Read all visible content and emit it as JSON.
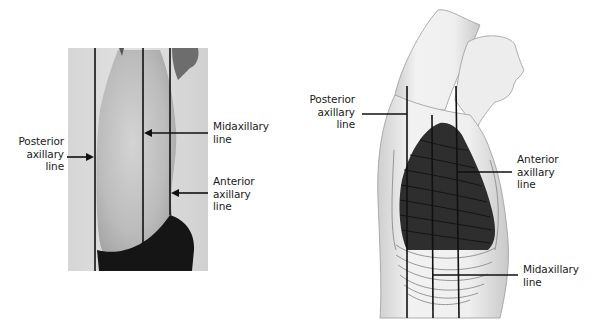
{
  "figure": {
    "left_panel": {
      "type": "photograph",
      "subject": "lateral view of torso with arm raised",
      "labels": {
        "posterior": {
          "line1": "Posterior",
          "line2": "axillary",
          "line3": "line"
        },
        "midaxillary": {
          "line1": "Midaxillary",
          "line2": "line"
        },
        "anterior": {
          "line1": "Anterior",
          "line2": "axillary",
          "line3": "line"
        }
      }
    },
    "right_panel": {
      "type": "illustration",
      "subject": "lateral view of thorax with lung and ribs",
      "labels": {
        "posterior": {
          "line1": "Posterior",
          "line2": "axillary",
          "line3": "line"
        },
        "anterior": {
          "line1": "Anterior",
          "line2": "axillary",
          "line3": "line"
        },
        "midaxillary": {
          "line1": "Midaxillary",
          "line2": "line"
        }
      }
    },
    "colors": {
      "line": "#111111",
      "lung": "#2e2e2e",
      "skin_light": "#ececec",
      "skin_shadow": "#bdbdbd"
    }
  }
}
